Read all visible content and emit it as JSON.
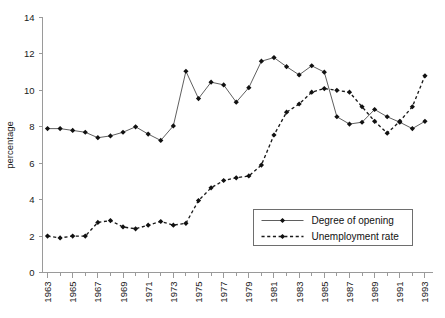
{
  "chart_data": {
    "type": "line",
    "title": "",
    "xlabel": "",
    "ylabel": "percentage",
    "ylim": [
      0,
      14
    ],
    "ytick_step": 2,
    "yticks": [
      "0",
      "2",
      "4",
      "6",
      "8",
      "10",
      "12",
      "14"
    ],
    "grid": false,
    "legend_position": "inside-lower-right",
    "x": [
      1963,
      1964,
      1965,
      1966,
      1967,
      1968,
      1969,
      1970,
      1971,
      1972,
      1973,
      1974,
      1975,
      1976,
      1977,
      1978,
      1979,
      1980,
      1981,
      1982,
      1983,
      1984,
      1985,
      1986,
      1987,
      1988,
      1989,
      1990,
      1991,
      1992,
      1993
    ],
    "xtick_labels": [
      "1963",
      "1965",
      "1967",
      "1969",
      "1971",
      "1973",
      "1975",
      "1977",
      "1979",
      "1981",
      "1983",
      "1985",
      "1987",
      "1989",
      "1991",
      "1993"
    ],
    "xtick_values": [
      1963,
      1965,
      1967,
      1969,
      1971,
      1973,
      1975,
      1977,
      1979,
      1981,
      1983,
      1985,
      1987,
      1989,
      1991,
      1993
    ],
    "xlim": [
      1962.6,
      1993.6
    ],
    "series": [
      {
        "name": "Degree of opening",
        "style": "solid",
        "marker": "filled-diamond",
        "color": "#4d4d4d",
        "values": [
          7.9,
          7.9,
          7.8,
          7.7,
          7.4,
          7.5,
          7.7,
          8.0,
          7.6,
          7.25,
          8.05,
          11.05,
          9.55,
          10.45,
          10.3,
          9.35,
          10.15,
          11.6,
          11.8,
          11.3,
          10.85,
          11.35,
          11.0,
          8.55,
          8.15,
          8.25,
          8.95,
          8.55,
          8.25,
          7.9,
          8.3
        ]
      },
      {
        "name": "Unemployment rate",
        "style": "dashed",
        "marker": "filled-diamond",
        "color": "#1a1a1a",
        "values": [
          2.0,
          1.9,
          2.0,
          2.0,
          2.75,
          2.85,
          2.5,
          2.4,
          2.6,
          2.8,
          2.6,
          2.7,
          3.95,
          4.65,
          5.05,
          5.2,
          5.3,
          5.9,
          7.55,
          8.8,
          9.25,
          9.9,
          10.1,
          10.0,
          9.9,
          9.1,
          8.3,
          7.65,
          8.3,
          9.1,
          10.8
        ]
      }
    ],
    "legend": [
      {
        "label": "Degree of opening",
        "style": "solid"
      },
      {
        "label": "Unemployment rate",
        "style": "dashed"
      }
    ]
  }
}
